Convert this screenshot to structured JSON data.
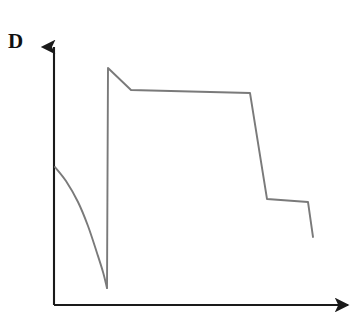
{
  "figure": {
    "y_axis_label": "D",
    "background_color": "#ffffff",
    "axis_color": "#1a1a1a",
    "curve_color": "#7a7a7a"
  },
  "chart_data": {
    "type": "line",
    "title": "",
    "xlabel": "",
    "ylabel": "D",
    "grid": false,
    "legend": null,
    "axes": {
      "x_axis": {
        "from": [
          54,
          305
        ],
        "to": [
          352,
          305
        ],
        "arrow": true,
        "ticks": [],
        "tick_labels": []
      },
      "y_axis": {
        "from": [
          54,
          305
        ],
        "to": [
          54,
          45
        ],
        "arrow": true,
        "ticks": [],
        "tick_labels": []
      }
    },
    "annotations": [
      {
        "text": "D",
        "x": 18,
        "y": 46,
        "bold": true
      }
    ],
    "series": [
      {
        "name": "decay-segment",
        "style": "curve",
        "points": [
          [
            55,
            167
          ],
          [
            66,
            181
          ],
          [
            78,
            202
          ],
          [
            88,
            226
          ],
          [
            97,
            253
          ],
          [
            103,
            272
          ],
          [
            107,
            288
          ]
        ]
      },
      {
        "name": "recovery-and-plateau-segment",
        "style": "polyline",
        "points": [
          [
            107,
            288
          ],
          [
            108,
            68
          ],
          [
            131,
            90
          ],
          [
            250,
            93
          ],
          [
            267,
            199
          ],
          [
            308,
            202
          ],
          [
            313,
            237
          ]
        ]
      }
    ],
    "x": [
      55,
      66,
      78,
      88,
      97,
      103,
      107,
      108,
      131,
      250,
      267,
      308,
      313
    ],
    "values": [
      167,
      181,
      202,
      226,
      253,
      272,
      288,
      68,
      90,
      93,
      199,
      202,
      237
    ],
    "xlim": [
      54,
      352
    ],
    "ylim": [
      305,
      45
    ]
  }
}
